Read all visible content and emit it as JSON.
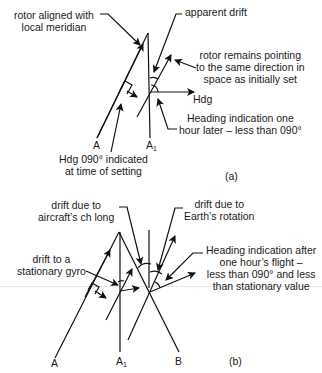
{
  "figure": {
    "part_a": {
      "caption": "(a)",
      "labels": {
        "rotor_aligned_1": "rotor aligned with",
        "rotor_aligned_2": "local meridian",
        "apparent_drift": "apparent drift",
        "rotor_remains_1": "rotor remains pointing",
        "rotor_remains_2": "to the same direction in",
        "rotor_remains_3": "space as initially set",
        "hdg": "Hdg",
        "heading_later_1": "Heading indication one",
        "heading_later_2": "hour later – less than 090°",
        "hdg_set_1": "Hdg 090° indicated",
        "hdg_set_2": "at time of setting",
        "point_a": "A",
        "point_a1": "A",
        "point_a1_sub": "1"
      }
    },
    "part_b": {
      "caption": "(b)",
      "labels": {
        "drift_aircraft_1": "drift due to",
        "drift_aircraft_2": "aircraft’s ch long",
        "drift_earth_1": "drift due to",
        "drift_earth_2": "Earth’s rotation",
        "drift_stationary_1": "drift to a",
        "drift_stationary_2": "stationary gyro",
        "heading_after_1": "Heading indication after",
        "heading_after_2": "one hour’s flight –",
        "heading_after_3": "less than 090° and less",
        "heading_after_4": "than stationary value",
        "point_a": "A",
        "point_a1": "A",
        "point_a1_sub": "1",
        "point_b": "B"
      }
    },
    "colors": {
      "ink": "#111111",
      "background": "#ffffff"
    }
  }
}
